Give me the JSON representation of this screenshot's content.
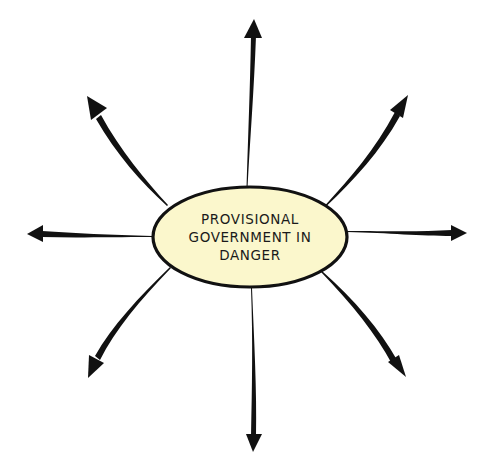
{
  "diagram": {
    "type": "spider-diagram",
    "center": {
      "label_lines": [
        "PROVISIONAL",
        "GOVERNMENT IN",
        "DANGER"
      ],
      "fill_color": "#FBF7CC",
      "stroke_color": "#111111"
    },
    "arrow_color": "#111111",
    "arrows": [
      {
        "direction": "up"
      },
      {
        "direction": "up-right"
      },
      {
        "direction": "right"
      },
      {
        "direction": "down-right"
      },
      {
        "direction": "down"
      },
      {
        "direction": "down-left"
      },
      {
        "direction": "left"
      },
      {
        "direction": "up-left"
      }
    ]
  }
}
